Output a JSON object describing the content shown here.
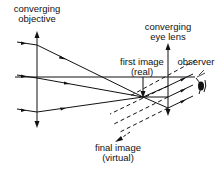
{
  "diagram": {
    "labels": {
      "objective_line1": "converging",
      "objective_line2": "objective",
      "eyelens_line1": "converging",
      "eyelens_line2": "eye lens",
      "first_image_line1": "first image",
      "first_image_line2": "(real)",
      "observer": "observer",
      "final_image_line1": "final image",
      "final_image_line2": "(virtual)"
    },
    "colors": {
      "line": "#111111",
      "background": "#ffffff"
    }
  }
}
